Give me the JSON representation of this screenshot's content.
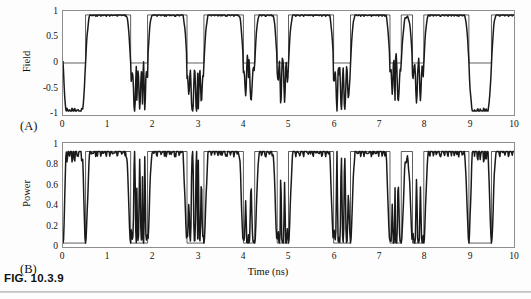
{
  "figure": {
    "caption": "FIG. 10.3.9",
    "panel_a_label": "(A)",
    "panel_b_label": "(B)"
  },
  "axes": {
    "x_title": "Time (ns)",
    "x_ticks": [
      "0",
      "1",
      "2",
      "3",
      "4",
      "5",
      "6",
      "7",
      "8",
      "9",
      "10"
    ],
    "panel_a_y_title": "Field",
    "panel_a_y_ticks": [
      "1",
      "0.5",
      "0",
      "-0.5",
      "-1"
    ],
    "panel_b_y_title": "Power",
    "panel_b_y_ticks": [
      "1",
      "0.8",
      "0.6",
      "0.4",
      "0.2",
      "0"
    ]
  },
  "colors": {
    "trace": "#1a1a1a",
    "message": "#3d3d3d",
    "frame": "#8e8e8e",
    "background": "#ffffff"
  },
  "chart_data": {
    "type": "line",
    "title": "FIG. 10.3.9",
    "xlabel": "Time (ns)",
    "panels": [
      {
        "label": "(A)",
        "ylabel": "Field",
        "xlim": [
          0,
          10
        ],
        "ylim": [
          -1,
          1
        ],
        "grid": false,
        "yticks": [
          -1,
          -0.5,
          0,
          0.5,
          1
        ],
        "xticks": [
          0,
          1,
          2,
          3,
          4,
          5,
          6,
          7,
          8,
          9,
          10
        ],
        "series": [
          {
            "name": "message",
            "style": "thin-square",
            "description": "Binary NRZ message signal switching between 0 and 1",
            "bit_duration_ns": 0.125,
            "bits": [
              0,
              0,
              0,
              0,
              1,
              1,
              1,
              1,
              1,
              1,
              1,
              1,
              0,
              0,
              0,
              1,
              1,
              1,
              1,
              1,
              1,
              1,
              0,
              0,
              0,
              1,
              1,
              1,
              1,
              1,
              1,
              1,
              0,
              0,
              1,
              1,
              1,
              1,
              0,
              0,
              1,
              1,
              1,
              1,
              1,
              1,
              1,
              1,
              0,
              0,
              0,
              1,
              1,
              1,
              1,
              1,
              1,
              1,
              0,
              0,
              1,
              1,
              0,
              0,
              1,
              1,
              1,
              1,
              1,
              1,
              1,
              1,
              0,
              0,
              0,
              0,
              1,
              1,
              1,
              1,
              1,
              1,
              0,
              0,
              1,
              1,
              0,
              0,
              1,
              1,
              0,
              0,
              1,
              1,
              1,
              1,
              1,
              1,
              1,
              1,
              0,
              0,
              0,
              0,
              1,
              1,
              1,
              1,
              1,
              1,
              1,
              1,
              0,
              0,
              0,
              1,
              1,
              1,
              1,
              1,
              1,
              1,
              0,
              0,
              1,
              1,
              0,
              0,
              1,
              1,
              0,
              0,
              1,
              1,
              1,
              1,
              1,
              1,
              0,
              0,
              1,
              1,
              1,
              1,
              1,
              1,
              1,
              1,
              0,
              0,
              0,
              0,
              1,
              1,
              1,
              1,
              1,
              1,
              1,
              1,
              0,
              0,
              1,
              1,
              0,
              0,
              1,
              1,
              0,
              0,
              1,
              1,
              1,
              1,
              1,
              1,
              1,
              1,
              0,
              0,
              0,
              0,
              1,
              1,
              1,
              1,
              1,
              1,
              0,
              0,
              1,
              1,
              0,
              0,
              1,
              1,
              0,
              0,
              1,
              1,
              1,
              1,
              0,
              0,
              1,
              1,
              1,
              1,
              1,
              1,
              1,
              1,
              0,
              0,
              0,
              0,
              1,
              1,
              1,
              1,
              1,
              1,
              1,
              1,
              0,
              0,
              0,
              0,
              1,
              1,
              1,
              1,
              1,
              1,
              1,
              1,
              0,
              0,
              0,
              0,
              1,
              1,
              1,
              1,
              0,
              0,
              1,
              1,
              0,
              0,
              1,
              1,
              1,
              1,
              1,
              1,
              1,
              1,
              0,
              0,
              0,
              0,
              1,
              1,
              1,
              1,
              0,
              0,
              1,
              1,
              0,
              0,
              1,
              1,
              0,
              0,
              1,
              1,
              1,
              1,
              1,
              1,
              1,
              1,
              0,
              0,
              0,
              0,
              1,
              1,
              1,
              1,
              1,
              1,
              1,
              1,
              0,
              0,
              0,
              1,
              1,
              1,
              1,
              1,
              1,
              1,
              0,
              0,
              1,
              1,
              0,
              0,
              1,
              1,
              0,
              0,
              1,
              1,
              1,
              1,
              1,
              1,
              1,
              1,
              0,
              0,
              0,
              0
            ]
          },
          {
            "name": "field",
            "style": "thick-smooth",
            "description": "Chaotic optical field, smoothed bipolar waveform following the message with oscillatory transitions",
            "range": [
              -1,
              1
            ]
          }
        ]
      },
      {
        "label": "(B)",
        "ylabel": "Power",
        "xlim": [
          0,
          10
        ],
        "ylim": [
          0,
          1.05
        ],
        "grid": false,
        "yticks": [
          0,
          0.2,
          0.4,
          0.6,
          0.8,
          1
        ],
        "xticks": [
          0,
          1,
          2,
          3,
          4,
          5,
          6,
          7,
          8,
          9,
          10
        ],
        "series": [
          {
            "name": "message",
            "style": "thin-square",
            "description": "Binary NRZ message signal switching between 0 and 1",
            "bit_duration_ns": 0.125
          },
          {
            "name": "power",
            "style": "thick-smooth",
            "description": "Optical power, square of the field, unipolar 0 to 1",
            "range": [
              0,
              1
            ]
          }
        ]
      }
    ]
  }
}
